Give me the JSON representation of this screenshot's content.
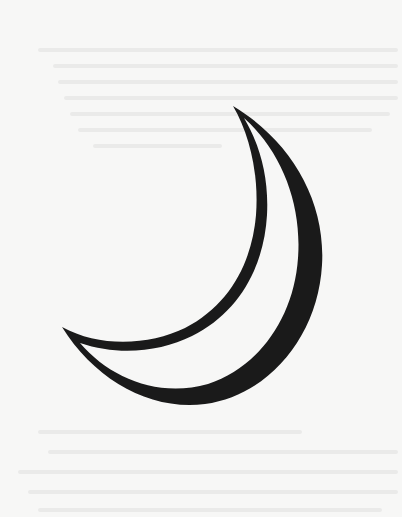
{
  "page": {
    "background_color": "#f7f7f6",
    "content_type": "illustration"
  },
  "illustration": {
    "subject": "crescent-moon",
    "stroke_color": "#1a1a1a",
    "fill_color": "#f7f7f6",
    "top_tip": [
      233,
      106
    ],
    "bottom_tip": [
      62,
      327
    ]
  },
  "bleed_through": {
    "legible": false,
    "color": "#e6e6e6"
  }
}
